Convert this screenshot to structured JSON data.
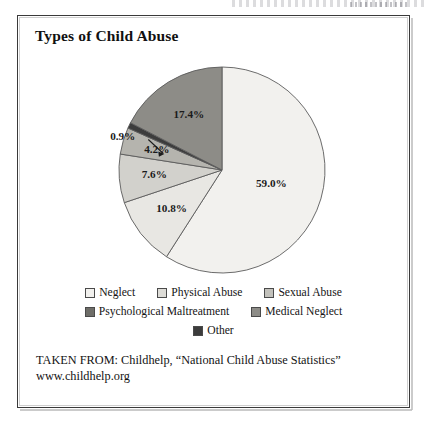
{
  "figure": {
    "title": "Types of Child Abuse"
  },
  "chart_data": {
    "type": "pie",
    "title": "Types of Child Abuse",
    "xlabel": "",
    "ylabel": "",
    "legend_position": "bottom",
    "grid": false,
    "units": "percent",
    "start_angle_deg": 0,
    "direction": "clockwise",
    "categories": [
      "Neglect",
      "Physical Abuse",
      "Sexual Abuse",
      "Psychological Maltreatment",
      "Other",
      "Medical Neglect"
    ],
    "values": [
      59.0,
      10.8,
      7.6,
      4.2,
      0.9,
      17.4
    ],
    "data_labels": [
      "59.0%",
      "10.8%",
      "7.6%",
      "4.2%",
      "0.9%",
      "17.4%"
    ],
    "colors": [
      "#f2f1ee",
      "#e8e7e3",
      "#d2d1cc",
      "#b5b4ae",
      "#3c3c3c",
      "#8d8c87"
    ],
    "slices": [
      {
        "label": "Neglect",
        "value": 59.0,
        "display": "59.0%",
        "color": "#f2f1ee",
        "label_inside": true
      },
      {
        "label": "Physical Abuse",
        "value": 10.8,
        "display": "10.8%",
        "color": "#e8e7e3",
        "label_inside": true
      },
      {
        "label": "Sexual Abuse",
        "value": 7.6,
        "display": "7.6%",
        "color": "#d2d1cc",
        "label_inside": true
      },
      {
        "label": "Psychological Maltreatment",
        "value": 4.2,
        "display": "4.2%",
        "color": "#b5b4ae",
        "label_inside": true
      },
      {
        "label": "Other",
        "value": 0.9,
        "display": "0.9%",
        "color": "#3c3c3c",
        "label_inside": false
      },
      {
        "label": "Medical Neglect",
        "value": 17.4,
        "display": "17.4%",
        "color": "#8d8c87",
        "label_inside": true
      }
    ]
  },
  "legend": {
    "rows": [
      [
        {
          "label": "Neglect",
          "color": "#f2f1ee"
        },
        {
          "label": "Physical Abuse",
          "color": "#dddcd7"
        },
        {
          "label": "Sexual Abuse",
          "color": "#c2c1bb"
        }
      ],
      [
        {
          "label": "Psychological Maltreatment",
          "color": "#6e6d68"
        },
        {
          "label": "Medical Neglect",
          "color": "#8d8c87"
        }
      ],
      [
        {
          "label": "Other",
          "color": "#3c3c3c"
        }
      ]
    ]
  },
  "source": {
    "line1": "TAKEN FROM: Childhelp, “National Child Abuse Statistics”",
    "line2": "www.childhelp.org"
  }
}
